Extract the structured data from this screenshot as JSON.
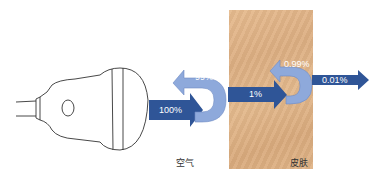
{
  "diagram": {
    "type": "ultrasound-transmission",
    "colors": {
      "arrow_dark": "#2f5597",
      "arrow_light": "#8ea9db",
      "skin": "#dfb385",
      "outline": "#333333"
    },
    "arrows": {
      "incident": "100%",
      "reflect_air": "99%",
      "transmit_skin": "1%",
      "reflect_skin": "0.99%",
      "transmit_out": "0.01%"
    },
    "labels": {
      "air": "空气",
      "skin": "皮肤"
    }
  }
}
